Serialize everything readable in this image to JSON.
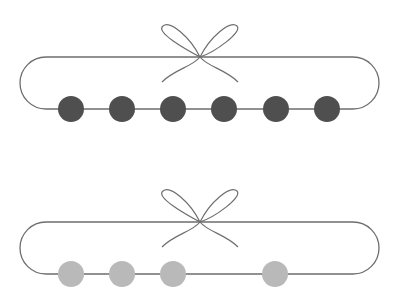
{
  "colors": {
    "background": "#ffffff",
    "rope": "#6e6e6e",
    "bead_full": "#4f4f4f",
    "bead_partial": "#b9b9b9"
  },
  "necklaces": [
    {
      "name": "necklace-top",
      "bead_color": "#4f4f4f",
      "bead_count": 6,
      "bead_positions_x": [
        71,
        122,
        173,
        224,
        276,
        327
      ]
    },
    {
      "name": "necklace-bottom",
      "bead_color": "#b9b9b9",
      "bead_count": 4,
      "bead_positions_x": [
        71,
        122,
        173,
        275
      ]
    }
  ]
}
